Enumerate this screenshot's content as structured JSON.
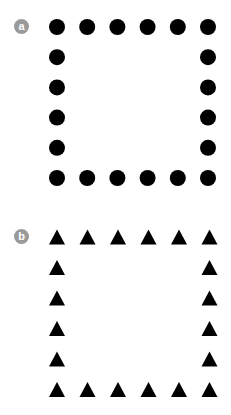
{
  "figures": [
    {
      "label": "a",
      "shape": "circle",
      "color": "#000000",
      "grid_size": 6,
      "arrangement": "square-perimeter",
      "count": 20
    },
    {
      "label": "b",
      "shape": "triangle",
      "color": "#000000",
      "grid_size": 6,
      "arrangement": "square-perimeter",
      "count": 20
    }
  ],
  "badge_color": "#9a9a9a"
}
